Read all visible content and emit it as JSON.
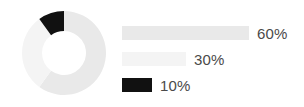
{
  "canvas": {
    "width": 304,
    "height": 107,
    "background": "#ffffff"
  },
  "chart_data": {
    "type": "pie",
    "variant": "donut",
    "title": "",
    "subtitle": "",
    "xlabel": "",
    "ylabel": "",
    "grid": false,
    "legend_position": "right",
    "legend_style": "proportional-bars",
    "total": 100,
    "units": "%",
    "start_angle_deg": 0,
    "direction": "clockwise",
    "inner_radius_ratio": 0.52,
    "categories": [
      "60%",
      "30%",
      "10%"
    ],
    "values": [
      60,
      30,
      10
    ],
    "labels": [
      "60%",
      "30%",
      "10%"
    ],
    "colors": [
      "#e9e9e9",
      "#f4f4f4",
      "#111111"
    ],
    "slices": [
      {
        "label": "60%",
        "value": 60,
        "color": "#e9e9e9",
        "start_deg": 0,
        "sweep_deg": 216
      },
      {
        "label": "30%",
        "value": 30,
        "color": "#f4f4f4",
        "start_deg": 216,
        "sweep_deg": 108
      },
      {
        "label": "10%",
        "value": 10,
        "color": "#111111",
        "start_deg": 324,
        "sweep_deg": 36
      }
    ]
  },
  "donut": {
    "center_x": 43,
    "center_y": 43,
    "outer_radius": 42,
    "inner_radius": 22
  },
  "legend": {
    "text_color": "#4a4a4a",
    "rows": [
      {
        "label": "60%",
        "value": 60,
        "color": "#e9e9e9",
        "bar_width": 127
      },
      {
        "label": "30%",
        "value": 30,
        "color": "#f4f4f4",
        "bar_width": 64
      },
      {
        "label": "10%",
        "value": 10,
        "color": "#111111",
        "bar_width": 30
      }
    ]
  }
}
